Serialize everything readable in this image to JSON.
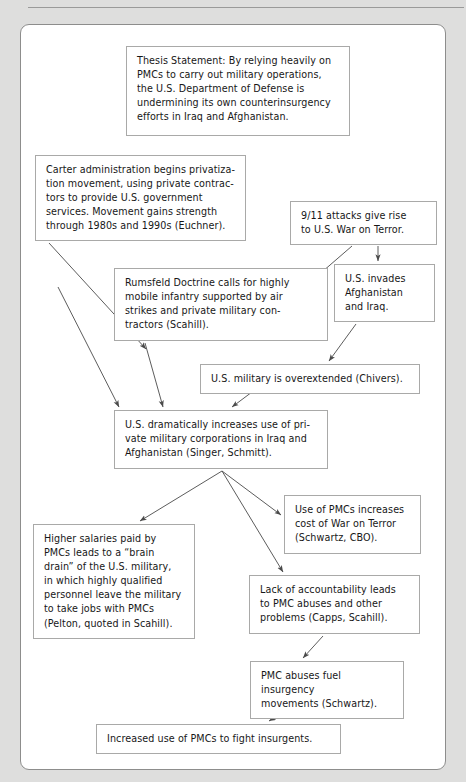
{
  "document": {
    "type": "concept-flow-map",
    "topic": "PMCs and U.S. counterinsurgency",
    "header_ghost_text": ""
  },
  "theme": {
    "page_background": "#dededd",
    "panel_background": "#ffffff",
    "panel_border": "#8d8d8c",
    "node_border": "#a9a9a8",
    "node_background": "#ffffff",
    "text_color": "#171717",
    "arrow_color": "#4a4a4a"
  },
  "nodes": [
    {
      "id": "thesis",
      "name": "thesis-statement-box",
      "text": "Thesis Statement: By relying heavily on PMCs to carry out military operations, the U.S. Department of Defense is undermining its own counterinsurgency efforts in Iraq and Afghanistan.",
      "x": 126,
      "y": 46,
      "w": 224,
      "h": 90
    },
    {
      "id": "carter",
      "name": "carter-administration-box",
      "text": "Carter administration begins privatiza-\ntion movement, using private contrac-\ntors to provide U.S. government\nservices. Movement gains strength\nthrough 1980s and 1990s (Euchner).",
      "x": 35,
      "y": 155,
      "w": 211,
      "h": 86
    },
    {
      "id": "attacks",
      "name": "nine-eleven-attacks-box",
      "text": "9/11 attacks give rise\nto U.S. War on Terror.",
      "x": 290,
      "y": 201,
      "w": 147,
      "h": 43
    },
    {
      "id": "rumsfeld",
      "name": "rumsfeld-doctrine-box",
      "text": "Rumsfeld Doctrine calls for highly\nmobile infantry supported by air\nstrikes and private military con-\ntractors (Scahill).",
      "x": 114,
      "y": 268,
      "w": 214,
      "h": 73
    },
    {
      "id": "invades",
      "name": "us-invades-box",
      "text": "U.S. invades\nAfghanistan\nand Iraq.",
      "x": 334,
      "y": 264,
      "w": 101,
      "h": 58
    },
    {
      "id": "overextended",
      "name": "military-overextended-box",
      "text": "U.S. military is overextended (Chivers).",
      "x": 200,
      "y": 364,
      "w": 220,
      "h": 26
    },
    {
      "id": "increases",
      "name": "increases-pmc-use-box",
      "text": "U.S. dramatically increases use of pri-\nvate military corporations in Iraq and\nAfghanistan (Singer, Schmitt).",
      "x": 114,
      "y": 410,
      "w": 214,
      "h": 59
    },
    {
      "id": "cost",
      "name": "cost-of-war-box",
      "text": "Use of PMCs increases\ncost of War on Terror\n(Schwartz, CBO).",
      "x": 284,
      "y": 495,
      "w": 137,
      "h": 59
    },
    {
      "id": "salaries",
      "name": "higher-salaries-brain-drain-box",
      "text": "Higher salaries paid by\nPMCs leads to a “brain\ndrain” of the U.S. military,\nin which highly qualified\npersonnel leave the military\nto take jobs with PMCs\n(Pelton, quoted in Scahill).",
      "x": 33,
      "y": 524,
      "w": 162,
      "h": 110
    },
    {
      "id": "accountability",
      "name": "lack-of-accountability-box",
      "text": "Lack of accountability leads\nto PMC abuses and other\nproblems (Capps, Scahill).",
      "x": 249,
      "y": 575,
      "w": 171,
      "h": 59
    },
    {
      "id": "insurgency",
      "name": "pmc-abuses-fuel-insurgency-box",
      "text": "PMC abuses fuel insurgency\nmovements (Schwartz).",
      "x": 250,
      "y": 661,
      "w": 154,
      "h": 44
    },
    {
      "id": "increased-use",
      "name": "increased-use-to-fight-insurgents-box",
      "text": "Increased use of PMCs to fight insurgents.",
      "x": 96,
      "y": 724,
      "w": 245,
      "h": 27
    }
  ],
  "arrows": [
    {
      "name": "arrow-carter-to-rumsfeld",
      "from": "carter",
      "to": "rumsfeld",
      "x1": 49,
      "y1": 243,
      "x2": 146,
      "y2": 349
    },
    {
      "name": "arrow-attacks-to-rumsfeld",
      "from": "attacks",
      "to": "rumsfeld",
      "x1": 352,
      "y1": 246,
      "x2": 300,
      "y2": 291
    },
    {
      "name": "arrow-attacks-to-invades",
      "from": "attacks",
      "to": "invades",
      "x1": 378,
      "y1": 246,
      "x2": 378,
      "y2": 261
    },
    {
      "name": "arrow-invades-to-overextended",
      "from": "invades",
      "to": "overextended",
      "x1": 356,
      "y1": 324,
      "x2": 329,
      "y2": 361
    },
    {
      "name": "arrow-overextended-to-increases",
      "from": "overextended",
      "to": "increases",
      "x1": 252,
      "y1": 392,
      "x2": 232,
      "y2": 407
    },
    {
      "name": "arrow-rumsfeld-to-increases",
      "from": "rumsfeld",
      "to": "increases",
      "x1": 145,
      "y1": 343,
      "x2": 163,
      "y2": 407
    },
    {
      "name": "arrow-carter-to-increases",
      "from": "carter",
      "to": "increases",
      "x1": 58,
      "y1": 287,
      "x2": 119,
      "y2": 407
    },
    {
      "name": "arrow-increases-to-salaries",
      "from": "increases",
      "to": "salaries",
      "x1": 222,
      "y1": 471,
      "x2": 140,
      "y2": 521
    },
    {
      "name": "arrow-increases-to-accountability",
      "from": "increases",
      "to": "accountability",
      "x1": 222,
      "y1": 471,
      "x2": 283,
      "y2": 572
    },
    {
      "name": "arrow-increases-to-cost",
      "from": "increases",
      "to": "cost",
      "x1": 222,
      "y1": 471,
      "x2": 281,
      "y2": 515
    },
    {
      "name": "arrow-accountability-to-insurgency",
      "from": "accountability",
      "to": "insurgency",
      "x1": 323,
      "y1": 636,
      "x2": 303,
      "y2": 658
    },
    {
      "name": "arrow-insurgency-to-increased-use",
      "from": "insurgency",
      "to": "increased-use",
      "x1": 293,
      "y1": 707,
      "x2": 269,
      "y2": 721
    }
  ]
}
